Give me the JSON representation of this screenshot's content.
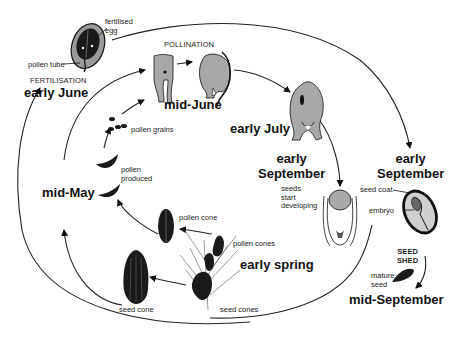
{
  "diagram": {
    "stages": {
      "early_june": "early June",
      "mid_june": "mid-June",
      "early_july": "early July",
      "early_september_a": "early\nSeptember",
      "early_september_b": "early\nSeptember",
      "mid_september": "mid-September",
      "mid_may": "mid-May",
      "early_spring": "early spring"
    },
    "process_labels": {
      "fertilisation": "FERTILISATION",
      "pollination": "POLLINATION",
      "seed_shed": "SEED\nSHED"
    },
    "part_labels": {
      "fertilised_egg": "fertilised\negg",
      "pollen_tube": "pollen tube",
      "pollen_grains": "pollen grains",
      "pollen_produced": "pollen\nproduced",
      "pollen_cone": "pollen cone",
      "pollen_cones": "pollen cones",
      "seed_cone": "seed cone",
      "seed_cones": "seed cones",
      "seeds_start_developing": "seeds\nstart\ndeveloping",
      "seed_coat": "seed coat",
      "embryo": "embryo",
      "mature_seed": "mature\nseed"
    },
    "colors": {
      "ink": "#111111",
      "fill_grey": "#a8a8a8",
      "fill_dark": "#1a1a1a"
    }
  }
}
